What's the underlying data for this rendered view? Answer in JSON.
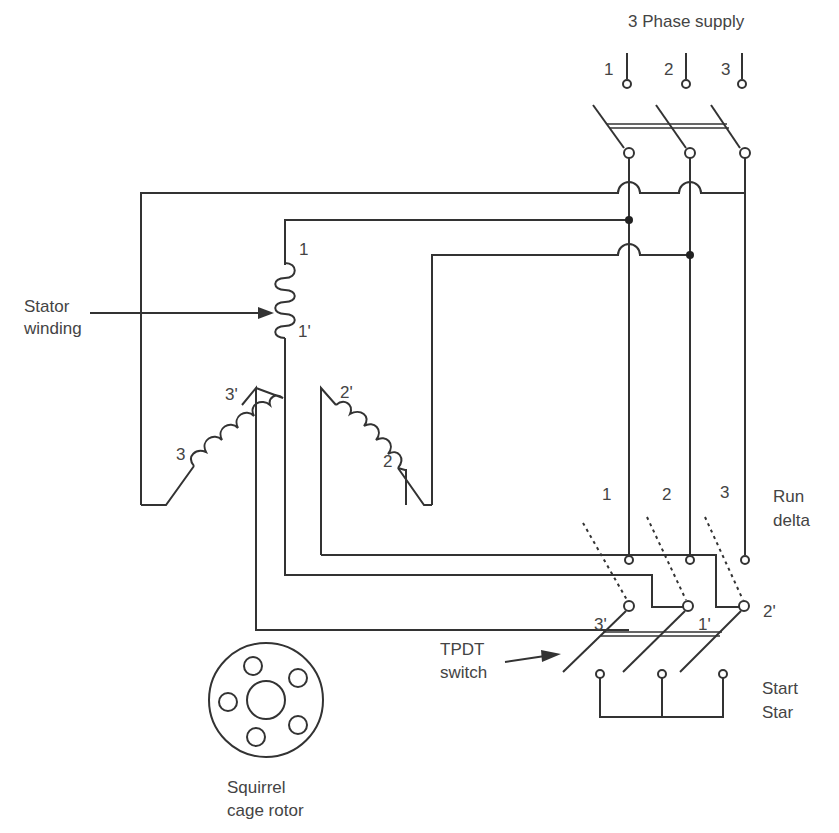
{
  "title": "3 Phase supply",
  "supply_terminals": [
    "1",
    "2",
    "3"
  ],
  "run_terminals": [
    "1",
    "2",
    "3"
  ],
  "run_label": [
    "Run",
    "delta"
  ],
  "start_terminals": [
    "3'",
    "1'",
    "2'"
  ],
  "start_label": [
    "Start",
    "Star"
  ],
  "stator_label": [
    "Stator",
    "winding"
  ],
  "coil_labels": {
    "c1_start": "1",
    "c1_end": "1'",
    "c2_start": "2",
    "c2_end": "2'",
    "c3_start": "3",
    "c3_end": "3'"
  },
  "switch_label": [
    "TPDT",
    "switch"
  ],
  "rotor_label": [
    "Squirrel",
    "cage rotor"
  ]
}
